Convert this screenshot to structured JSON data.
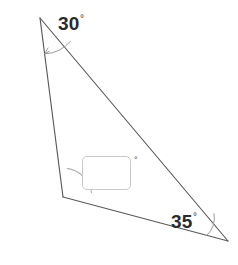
{
  "figure": {
    "type": "geometry-triangle-angle-problem",
    "background_color": "#ffffff",
    "stroke_color": "#5a5a5a",
    "arc_color": "#9a9a9a",
    "label_color": "#2b2b2b",
    "width": 238,
    "height": 265,
    "vertices": {
      "top": {
        "x": 40,
        "y": 18
      },
      "bottom_left": {
        "x": 63,
        "y": 197
      },
      "bottom_right": {
        "x": 228,
        "y": 241
      }
    },
    "angles": [
      {
        "name": "top-angle",
        "vertex": "top",
        "value": "30",
        "degree_symbol": "°",
        "marker": "arc-with-arrow"
      },
      {
        "name": "bottom-left-angle",
        "vertex": "bottom_left",
        "value": "",
        "degree_symbol": "°",
        "marker": "quarter-arc"
      },
      {
        "name": "bottom-right-angle",
        "vertex": "bottom_right",
        "value": "35",
        "degree_symbol": "°",
        "marker": "small-arc"
      }
    ]
  },
  "labels": {
    "top_angle": "30",
    "top_angle_degree": "°",
    "right_angle": "35",
    "right_angle_degree": "°"
  },
  "answer_field": {
    "value": "",
    "placeholder": "",
    "degree_symbol": "°"
  }
}
